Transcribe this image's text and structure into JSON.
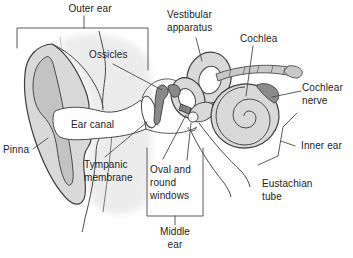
{
  "figure": {
    "type": "anatomical-diagram"
  },
  "labels": {
    "outer_ear": "Outer ear",
    "vestibular_apparatus": "Vestibular\napparatus",
    "cochlea": "Cochlea",
    "ossicles": "Ossicles",
    "cochlear_nerve": "Cochlear\nnerve",
    "ear_canal": "Ear canal",
    "inner_ear": "Inner ear",
    "pinna": "Pinna",
    "tympanic_membrane": "Tympanic\nmembrane",
    "oval_round_windows": "Oval and\nround\nwindows",
    "eustachian_tube": "Eustachian\ntube",
    "middle_ear": "Middle\near"
  },
  "colors": {
    "background": "#ffffff",
    "cutaway_light": "#ececec",
    "fill_light": "#d9d9d9",
    "fill_mid": "#c3c3c3",
    "fill_band": "#c9c9c9",
    "fill_dark": "#8a8a8a",
    "outline": "#3f3f3f",
    "text": "#1c1c1c"
  }
}
